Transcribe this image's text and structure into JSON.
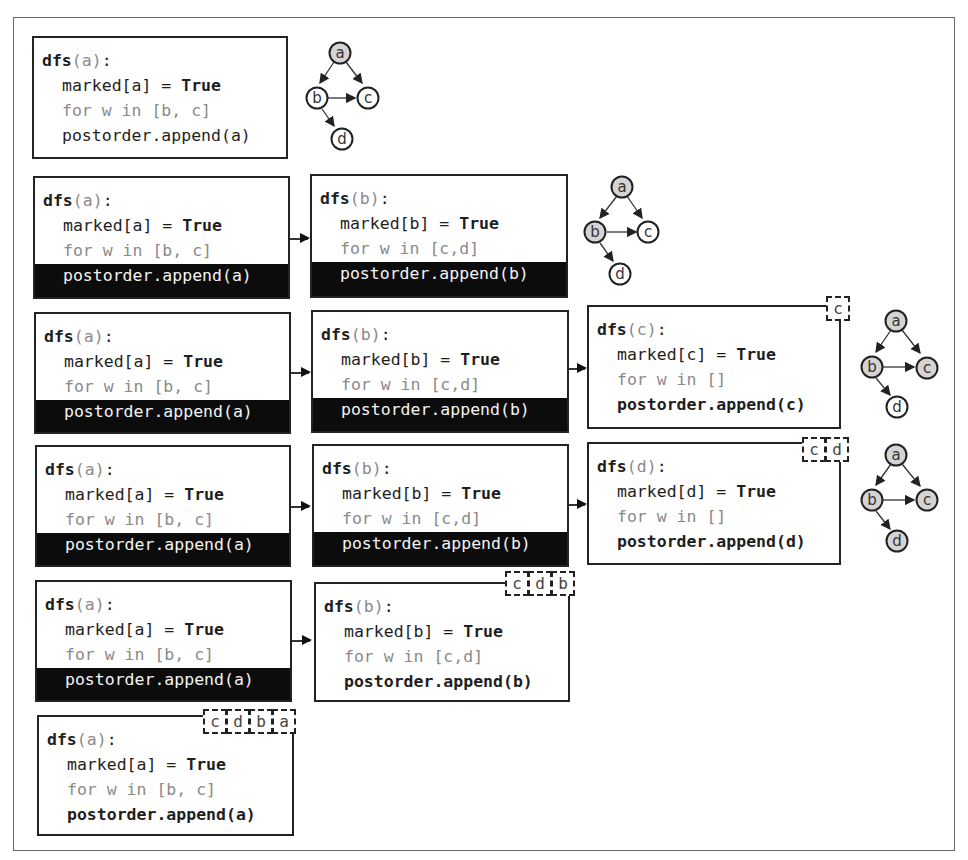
{
  "colors": {
    "frame": "#6b6b6b",
    "box_border": "#222222",
    "active_bar": "#0c0c0c",
    "muted_text": "#8a8a8a",
    "visited_node_fill": "#d4d4d4",
    "unvisited_node_fill": "#ffffff"
  },
  "rows": [
    {
      "frames": [
        {
          "name": "a",
          "header_fn": "dfs",
          "header_arg": "(a)",
          "header_colon": ":",
          "line1_pre": "marked[a] = ",
          "line1_kw": "True",
          "line2": "for w in [b, c]",
          "line3": "postorder.append(a)",
          "active": false,
          "bold_append": false
        }
      ],
      "postorder_stack": [],
      "graph": {
        "visited": [
          "a"
        ]
      }
    },
    {
      "frames": [
        {
          "name": "a",
          "header_fn": "dfs",
          "header_arg": "(a)",
          "header_colon": ":",
          "line1_pre": "marked[a] = ",
          "line1_kw": "True",
          "line2": "for w in [b, c]",
          "line3": "postorder.append(a)",
          "active": true
        },
        {
          "name": "b",
          "header_fn": "dfs",
          "header_arg": "(b)",
          "header_colon": ":",
          "line1_pre": "marked[b] = ",
          "line1_kw": "True",
          "line2": "for w in [c,d]",
          "line3": "postorder.append(b)",
          "active": true
        }
      ],
      "postorder_stack": [],
      "graph": {
        "visited": [
          "a",
          "b"
        ]
      }
    },
    {
      "frames": [
        {
          "name": "a",
          "header_fn": "dfs",
          "header_arg": "(a)",
          "header_colon": ":",
          "line1_pre": "marked[a] = ",
          "line1_kw": "True",
          "line2": "for w in [b, c]",
          "line3": "postorder.append(a)",
          "active": true
        },
        {
          "name": "b",
          "header_fn": "dfs",
          "header_arg": "(b)",
          "header_colon": ":",
          "line1_pre": "marked[b] = ",
          "line1_kw": "True",
          "line2": "for w in [c,d]",
          "line3": "postorder.append(b)",
          "active": true
        },
        {
          "name": "c",
          "header_fn": "dfs",
          "header_arg": "(c)",
          "header_colon": ":",
          "line1_pre": "marked[c] = ",
          "line1_kw": "True",
          "line2": "for w in []",
          "line3": "postorder.append(c)",
          "active": false,
          "bold_append": true
        }
      ],
      "postorder_stack": [
        "c"
      ],
      "graph": {
        "visited": [
          "a",
          "b",
          "c"
        ]
      }
    },
    {
      "frames": [
        {
          "name": "a",
          "header_fn": "dfs",
          "header_arg": "(a)",
          "header_colon": ":",
          "line1_pre": "marked[a] = ",
          "line1_kw": "True",
          "line2": "for w in [b, c]",
          "line3": "postorder.append(a)",
          "active": true
        },
        {
          "name": "b",
          "header_fn": "dfs",
          "header_arg": "(b)",
          "header_colon": ":",
          "line1_pre": "marked[b] = ",
          "line1_kw": "True",
          "line2": "for w in [c,d]",
          "line3": "postorder.append(b)",
          "active": true
        },
        {
          "name": "d",
          "header_fn": "dfs",
          "header_arg": "(d)",
          "header_colon": ":",
          "line1_pre": "marked[d] = ",
          "line1_kw": "True",
          "line2": "for w in []",
          "line3": "postorder.append(d)",
          "active": false,
          "bold_append": true
        }
      ],
      "postorder_stack": [
        "c",
        "d"
      ],
      "graph": {
        "visited": [
          "a",
          "b",
          "c",
          "d"
        ]
      }
    },
    {
      "frames": [
        {
          "name": "a",
          "header_fn": "dfs",
          "header_arg": "(a)",
          "header_colon": ":",
          "line1_pre": "marked[a] = ",
          "line1_kw": "True",
          "line2": "for w in [b, c]",
          "line3": "postorder.append(a)",
          "active": true
        },
        {
          "name": "b",
          "header_fn": "dfs",
          "header_arg": "(b)",
          "header_colon": ":",
          "line1_pre": "marked[b] = ",
          "line1_kw": "True",
          "line2": "for w in [c,d]",
          "line3": "postorder.append(b)",
          "active": false,
          "bold_append": true
        }
      ],
      "postorder_stack": [
        "c",
        "d",
        "b"
      ]
    },
    {
      "frames": [
        {
          "name": "a",
          "header_fn": "dfs",
          "header_arg": "(a)",
          "header_colon": ":",
          "line1_pre": "marked[a] = ",
          "line1_kw": "True",
          "line2": "for w in [b, c]",
          "line3": "postorder.append(a)",
          "active": false,
          "bold_append": true
        }
      ],
      "postorder_stack": [
        "c",
        "d",
        "b",
        "a"
      ]
    }
  ],
  "graph_nodes": {
    "a": "a",
    "b": "b",
    "c": "c",
    "d": "d"
  }
}
